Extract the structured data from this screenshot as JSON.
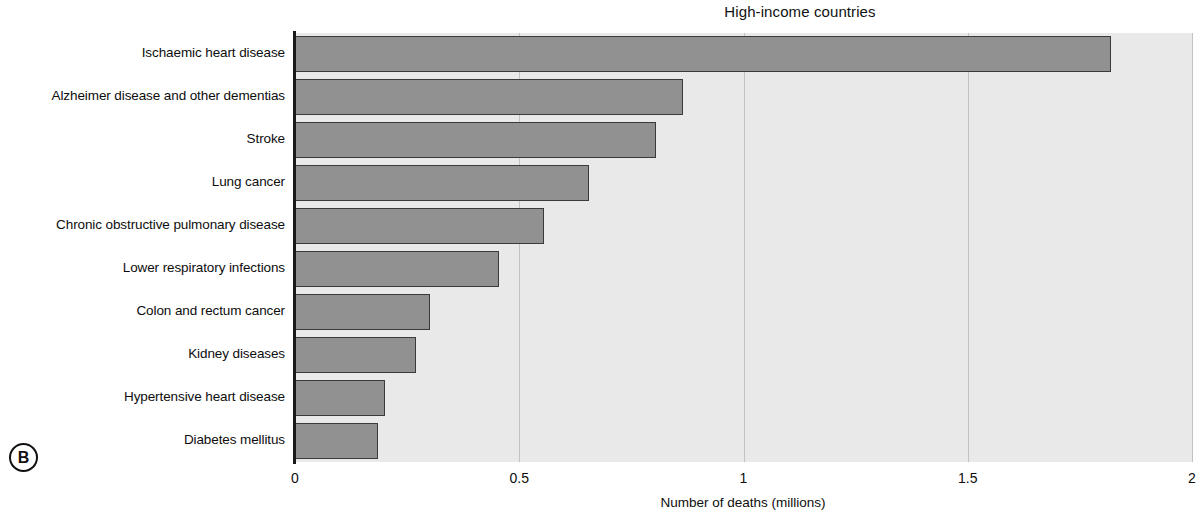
{
  "figure": {
    "panel_marker": "B",
    "title": "High-income countries"
  },
  "axis": {
    "x_title": "Number of deaths (millions)",
    "tick_labels": [
      "0",
      "0.5",
      "1",
      "1.5",
      "2"
    ]
  },
  "colors": {
    "bar_fill": "#919191",
    "bar_edge": "#3a3a3a",
    "plot_background": "#e9e9e9",
    "gridline": "#c2c2c2",
    "axis": "#1a1a1a",
    "text": "#0d0d0d"
  },
  "chart_data": {
    "type": "bar",
    "orientation": "horizontal",
    "title": "High-income countries",
    "xlabel": "Number of deaths (millions)",
    "ylabel": "",
    "xlim": [
      0,
      2
    ],
    "xticks": [
      0,
      0.5,
      1,
      1.5,
      2
    ],
    "grid": true,
    "legend": false,
    "categories": [
      "Ischaemic heart disease",
      "Alzheimer disease and other dementias",
      "Stroke",
      "Lung cancer",
      "Chronic obstructive pulmonary disease",
      "Lower respiratory infections",
      "Colon and rectum cancer",
      "Kidney diseases",
      "Hypertensive heart disease",
      "Diabetes mellitus"
    ],
    "values": [
      1.82,
      0.865,
      0.805,
      0.655,
      0.555,
      0.455,
      0.3,
      0.27,
      0.2,
      0.185
    ]
  }
}
